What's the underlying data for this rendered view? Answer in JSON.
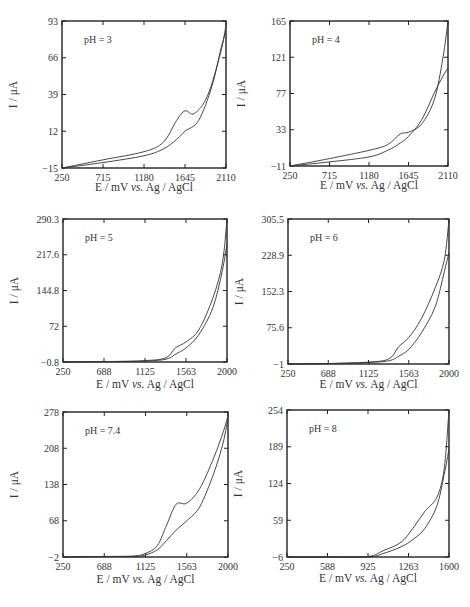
{
  "chart_data": [
    {
      "type": "line",
      "title": "pH = 3",
      "xlabel": "E / mV vs. Ag / AgCl",
      "ylabel": "I / μA",
      "xticks": [
        "250",
        "715",
        "1180",
        "1645",
        "2110"
      ],
      "yticks": [
        "-15",
        "12",
        "39",
        "66",
        "93"
      ],
      "xlim": [
        250,
        2110
      ],
      "ylim": [
        -15,
        93
      ],
      "series": [
        {
          "name": "forward",
          "x": [
            250,
            715,
            1180,
            1400,
            1550,
            1645,
            1750,
            1900,
            2050,
            2110
          ],
          "y": [
            -15,
            -9,
            -3,
            4,
            20,
            27,
            25,
            38,
            70,
            90
          ]
        },
        {
          "name": "reverse",
          "x": [
            250,
            715,
            1180,
            1400,
            1550,
            1645,
            1800,
            1950,
            2050,
            2110
          ],
          "y": [
            -15,
            -11,
            -6,
            -1,
            6,
            12,
            20,
            45,
            72,
            86
          ]
        }
      ]
    },
    {
      "type": "line",
      "title": "pH = 4",
      "xlabel": "E / mV vs. Ag / AgCl",
      "ylabel": "I / μA",
      "xticks": [
        "250",
        "715",
        "1180",
        "1645",
        "2110"
      ],
      "yticks": [
        "-11",
        "33",
        "77",
        "121",
        "165"
      ],
      "xlim": [
        250,
        2110
      ],
      "ylim": [
        -11,
        165
      ],
      "series": [
        {
          "name": "forward",
          "x": [
            250,
            715,
            1180,
            1400,
            1550,
            1645,
            1800,
            1950,
            2050,
            2110
          ],
          "y": [
            -11,
            -2,
            8,
            15,
            28,
            30,
            40,
            70,
            120,
            165
          ]
        },
        {
          "name": "reverse",
          "x": [
            250,
            715,
            1180,
            1400,
            1550,
            1645,
            1800,
            1950,
            2050,
            2110
          ],
          "y": [
            -11,
            -6,
            0,
            8,
            17,
            25,
            45,
            78,
            98,
            108
          ]
        }
      ]
    },
    {
      "type": "line",
      "title": "pH = 5",
      "xlabel": "E / mV vs. Ag / AgCl",
      "ylabel": "I / μA",
      "xticks": [
        "250",
        "688",
        "1125",
        "1563",
        "2000"
      ],
      "yticks": [
        "-0.8",
        "72",
        "144.8",
        "217.6",
        "290.3"
      ],
      "xlim": [
        250,
        2000
      ],
      "ylim": [
        -0.8,
        290.3
      ],
      "series": [
        {
          "name": "forward",
          "x": [
            250,
            688,
            1125,
            1350,
            1450,
            1563,
            1700,
            1850,
            1950,
            2000
          ],
          "y": [
            -0.8,
            0,
            2,
            8,
            28,
            40,
            65,
            130,
            200,
            290
          ]
        },
        {
          "name": "reverse",
          "x": [
            250,
            688,
            1125,
            1350,
            1450,
            1563,
            1700,
            1850,
            1950,
            2000
          ],
          "y": [
            -0.8,
            0,
            1,
            5,
            15,
            28,
            55,
            110,
            185,
            240
          ]
        }
      ]
    },
    {
      "type": "line",
      "title": "pH = 6",
      "xlabel": "E / mV vs. Ag / AgCl",
      "ylabel": "I / μA",
      "xticks": [
        "250",
        "688",
        "1125",
        "1563",
        "2000"
      ],
      "yticks": [
        "-1",
        "75.6",
        "152.3",
        "228.9",
        "305.5"
      ],
      "xlim": [
        250,
        2000
      ],
      "ylim": [
        -1,
        305.5
      ],
      "series": [
        {
          "name": "forward",
          "x": [
            250,
            688,
            1125,
            1350,
            1450,
            1563,
            1700,
            1850,
            1950,
            2000
          ],
          "y": [
            -1,
            0,
            3,
            10,
            35,
            55,
            95,
            160,
            220,
            305
          ]
        },
        {
          "name": "reverse",
          "x": [
            250,
            688,
            1125,
            1350,
            1450,
            1563,
            1700,
            1850,
            1950,
            2000
          ],
          "y": [
            -1,
            0,
            2,
            6,
            15,
            30,
            65,
            120,
            195,
            235
          ]
        }
      ]
    },
    {
      "type": "line",
      "title": "pH = 7.4",
      "xlabel": "E / mV vs. Ag / AgCl",
      "ylabel": "I / μA",
      "xticks": [
        "250",
        "688",
        "1125",
        "1563",
        "2000"
      ],
      "yticks": [
        "-2",
        "68",
        "138",
        "208",
        "278"
      ],
      "xlim": [
        250,
        2000
      ],
      "ylim": [
        -2,
        278
      ],
      "series": [
        {
          "name": "forward",
          "x": [
            250,
            688,
            1000,
            1125,
            1250,
            1350,
            1450,
            1563,
            1700,
            1850,
            1950,
            2000
          ],
          "y": [
            -2,
            -1,
            0,
            5,
            20,
            60,
            100,
            102,
            130,
            190,
            240,
            270
          ]
        },
        {
          "name": "reverse",
          "x": [
            250,
            688,
            1000,
            1125,
            1250,
            1350,
            1450,
            1563,
            1700,
            1850,
            1950,
            2000
          ],
          "y": [
            -2,
            -1,
            -1,
            2,
            12,
            30,
            50,
            68,
            95,
            160,
            220,
            268
          ]
        }
      ]
    },
    {
      "type": "line",
      "title": "pH = 8",
      "xlabel": "E / mV vs. Ag / AgCl",
      "ylabel": "I / μA",
      "xticks": [
        "250",
        "588",
        "925",
        "1263",
        "1600"
      ],
      "yticks": [
        "-6",
        "59",
        "124",
        "189",
        "254"
      ],
      "xlim": [
        250,
        1600
      ],
      "ylim": [
        -6,
        254
      ],
      "series": [
        {
          "name": "forward",
          "x": [
            250,
            588,
            925,
            1050,
            1200,
            1300,
            1400,
            1500,
            1560,
            1600
          ],
          "y": [
            -6,
            -6,
            -5,
            5,
            20,
            45,
            75,
            100,
            150,
            254
          ]
        },
        {
          "name": "reverse",
          "x": [
            250,
            588,
            925,
            1050,
            1200,
            1300,
            1400,
            1500,
            1560,
            1600
          ],
          "y": [
            -6,
            -6,
            -6,
            0,
            12,
            25,
            45,
            85,
            140,
            185
          ]
        }
      ]
    }
  ]
}
